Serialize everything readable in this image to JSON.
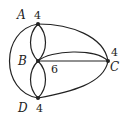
{
  "diagram": {
    "title": "",
    "nodes": [
      {
        "id": "A",
        "label": "A",
        "degree": "4",
        "x": 38,
        "y": 24
      },
      {
        "id": "B",
        "label": "B",
        "degree": "6",
        "x": 38,
        "y": 61
      },
      {
        "id": "C",
        "label": "C",
        "degree": "4",
        "x": 108,
        "y": 61
      },
      {
        "id": "D",
        "label": "D",
        "degree": "4",
        "x": 38,
        "y": 98
      }
    ],
    "edges": [
      {
        "from": "A",
        "to": "B",
        "count": 2
      },
      {
        "from": "B",
        "to": "D",
        "count": 2
      },
      {
        "from": "A",
        "to": "C",
        "count": 1
      },
      {
        "from": "B",
        "to": "C",
        "count": 2
      },
      {
        "from": "D",
        "to": "C",
        "count": 1
      },
      {
        "from": "A",
        "to": "D",
        "count": 1
      }
    ],
    "colors": {
      "stroke": "#222222",
      "background": "#ffffff"
    }
  }
}
